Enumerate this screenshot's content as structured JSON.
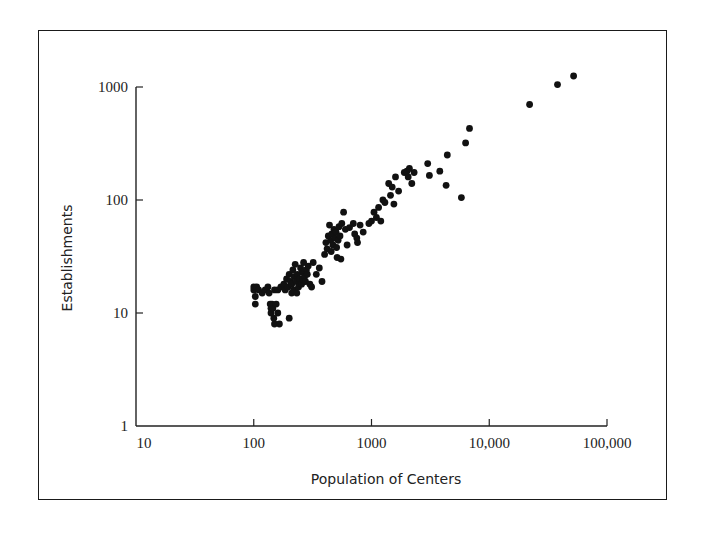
{
  "chart_data": {
    "type": "scatter",
    "title": "",
    "xlabel": "Population of Centers",
    "ylabel": "Establishments",
    "xscale": "log",
    "yscale": "log",
    "xlim": [
      10,
      100000
    ],
    "ylim": [
      1,
      1000
    ],
    "xticks": [
      "10",
      "100",
      "1000",
      "10,000",
      "100,000"
    ],
    "yticks": [
      "1",
      "10",
      "100",
      "1000"
    ],
    "grid": false,
    "legend": null,
    "marker_color": "#111111",
    "points": [
      [
        100,
        17
      ],
      [
        100,
        16
      ],
      [
        103,
        14
      ],
      [
        103,
        12
      ],
      [
        106,
        17
      ],
      [
        110,
        16
      ],
      [
        118,
        15
      ],
      [
        125,
        16
      ],
      [
        132,
        17
      ],
      [
        135,
        15
      ],
      [
        138,
        12
      ],
      [
        140,
        11
      ],
      [
        140,
        10
      ],
      [
        143,
        12
      ],
      [
        145,
        11
      ],
      [
        148,
        9
      ],
      [
        150,
        8
      ],
      [
        155,
        12
      ],
      [
        160,
        10
      ],
      [
        165,
        8
      ],
      [
        150,
        16
      ],
      [
        160,
        16
      ],
      [
        170,
        17
      ],
      [
        180,
        18
      ],
      [
        185,
        16
      ],
      [
        190,
        20
      ],
      [
        195,
        17
      ],
      [
        200,
        9
      ],
      [
        200,
        22
      ],
      [
        205,
        19
      ],
      [
        210,
        15
      ],
      [
        210,
        18
      ],
      [
        215,
        24
      ],
      [
        218,
        16
      ],
      [
        220,
        21
      ],
      [
        225,
        27
      ],
      [
        230,
        19
      ],
      [
        232,
        15
      ],
      [
        235,
        22
      ],
      [
        240,
        17
      ],
      [
        245,
        20
      ],
      [
        250,
        25
      ],
      [
        255,
        18
      ],
      [
        258,
        23
      ],
      [
        260,
        20
      ],
      [
        265,
        28
      ],
      [
        270,
        21
      ],
      [
        275,
        19
      ],
      [
        280,
        24
      ],
      [
        285,
        22
      ],
      [
        290,
        26
      ],
      [
        300,
        18
      ],
      [
        310,
        17
      ],
      [
        320,
        28
      ],
      [
        340,
        22
      ],
      [
        360,
        25
      ],
      [
        380,
        19
      ],
      [
        400,
        33
      ],
      [
        410,
        42
      ],
      [
        420,
        37
      ],
      [
        430,
        48
      ],
      [
        440,
        60
      ],
      [
        450,
        44
      ],
      [
        455,
        35
      ],
      [
        460,
        50
      ],
      [
        470,
        40
      ],
      [
        480,
        55
      ],
      [
        490,
        46
      ],
      [
        500,
        52
      ],
      [
        505,
        38
      ],
      [
        510,
        31
      ],
      [
        520,
        44
      ],
      [
        530,
        58
      ],
      [
        540,
        48
      ],
      [
        550,
        30
      ],
      [
        560,
        62
      ],
      [
        580,
        78
      ],
      [
        600,
        55
      ],
      [
        620,
        40
      ],
      [
        650,
        57
      ],
      [
        700,
        62
      ],
      [
        720,
        50
      ],
      [
        750,
        46
      ],
      [
        760,
        42
      ],
      [
        800,
        60
      ],
      [
        850,
        52
      ],
      [
        950,
        62
      ],
      [
        1000,
        65
      ],
      [
        1050,
        78
      ],
      [
        1100,
        70
      ],
      [
        1150,
        86
      ],
      [
        1200,
        65
      ],
      [
        1250,
        100
      ],
      [
        1300,
        95
      ],
      [
        1400,
        140
      ],
      [
        1450,
        110
      ],
      [
        1500,
        130
      ],
      [
        1550,
        92
      ],
      [
        1600,
        160
      ],
      [
        1700,
        120
      ],
      [
        1900,
        175
      ],
      [
        2000,
        180
      ],
      [
        2050,
        160
      ],
      [
        2100,
        190
      ],
      [
        2200,
        140
      ],
      [
        2300,
        175
      ],
      [
        3000,
        210
      ],
      [
        3100,
        165
      ],
      [
        3800,
        180
      ],
      [
        4300,
        135
      ],
      [
        4400,
        250
      ],
      [
        5800,
        105
      ],
      [
        6300,
        320
      ],
      [
        6800,
        430
      ],
      [
        22000,
        700
      ],
      [
        38000,
        1050
      ],
      [
        52000,
        1250
      ]
    ]
  }
}
